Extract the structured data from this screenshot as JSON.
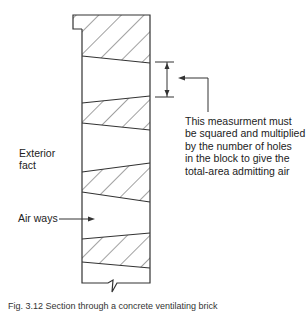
{
  "diagram": {
    "labels": {
      "annotation": [
        "This measurment must",
        "be squared and multiplied",
        "by the number of holes",
        "in the block to give the",
        "total-area admitting air"
      ],
      "exterior": [
        "Exterior",
        "fact"
      ],
      "airways": "Air ways"
    },
    "caption": "Fig. 3.12  Section through a concrete ventilating brick",
    "colors": {
      "line": "#333333",
      "background": "#ffffff"
    }
  }
}
